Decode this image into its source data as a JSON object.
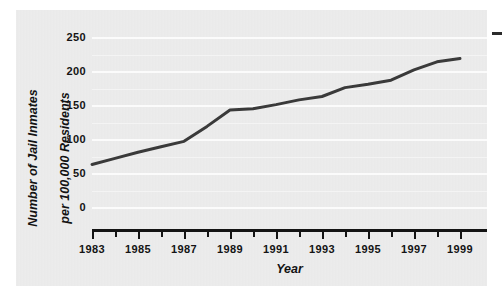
{
  "chart_data": {
    "type": "line",
    "title": "",
    "xlabel": "Year",
    "ylabel": "Number of Jail Inmates per 100,000 Residents",
    "ylabel_line1": "Number of Jail Inmates",
    "ylabel_line2": "per 100,000 Residents",
    "x": [
      1983,
      1984,
      1985,
      1986,
      1987,
      1988,
      1989,
      1990,
      1991,
      1992,
      1993,
      1994,
      1995,
      1996,
      1997,
      1998,
      1999
    ],
    "values": [
      64,
      73,
      82,
      90,
      98,
      120,
      144,
      146,
      152,
      159,
      164,
      177,
      182,
      188,
      203,
      215,
      220
    ],
    "series": [
      {
        "name": "Jail inmates per 100,000 residents",
        "values": [
          64,
          73,
          82,
          90,
          98,
          120,
          144,
          146,
          152,
          159,
          164,
          177,
          182,
          188,
          203,
          215,
          220
        ]
      }
    ],
    "xlim": [
      1983,
      1999
    ],
    "ylim": [
      0,
      250
    ],
    "ytick_values": [
      0,
      50,
      100,
      150,
      200,
      250
    ],
    "ytick_labels": [
      "0",
      "50",
      "100",
      "150",
      "200",
      "250"
    ],
    "y_minor_gridlines": [
      25,
      75,
      125,
      175,
      225
    ],
    "xtick_values": [
      1983,
      1984,
      1985,
      1986,
      1987,
      1988,
      1989,
      1990,
      1991,
      1992,
      1993,
      1994,
      1995,
      1996,
      1997,
      1998,
      1999
    ],
    "xtick_labels_major": [
      "1983",
      "1985",
      "1987",
      "1989",
      "1991",
      "1993",
      "1995",
      "1997",
      "1999"
    ],
    "xtick_major_values": [
      1983,
      1985,
      1987,
      1989,
      1991,
      1993,
      1995,
      1997,
      1999
    ],
    "grid": true,
    "grid_color": "#fbfbfb",
    "legend": false,
    "legend_position": "none",
    "line_color": "#3a3a3a",
    "line_width": 3,
    "panel_background": "#eaeaea",
    "axis_color": "#141414",
    "text_color": "#131313"
  },
  "marks": {
    "corner_dash": "dash-mark"
  }
}
